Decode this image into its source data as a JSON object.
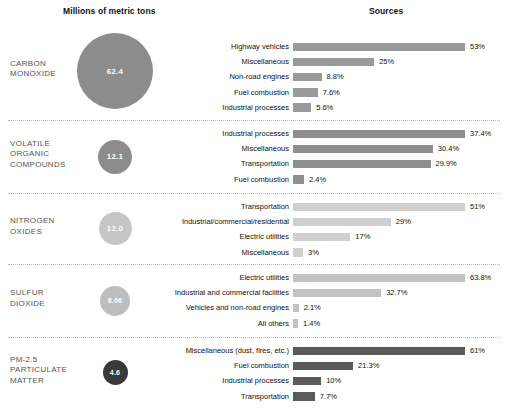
{
  "header": {
    "left_title": "Millions of metric tons",
    "right_title": "Sources"
  },
  "chart_data": {
    "type": "bar",
    "xlabel": "Sources",
    "ylabel": "Millions of metric tons",
    "grid": false,
    "legend": "none",
    "note": "Each pollutant panel shows total emissions (bubble, millions of metric tons) and the percentage breakdown of its sources (horizontal bars, normalized per panel).",
    "panels": [
      {
        "pollutant": "CARBON MONOXIDE",
        "total_label": "62.4",
        "total_value": 62.4,
        "bubble_diameter_px": 76,
        "bubble_color": "#8c8c8c",
        "bar_color": "#9a9a9a",
        "categories": [
          "Highway vehicles",
          "Miscellaneous",
          "Non-road engines",
          "Fuel combustion",
          "Industrial processes"
        ],
        "values": [
          53,
          25,
          8.8,
          7.6,
          5.6
        ],
        "value_labels": [
          "53%",
          "25%",
          "8.8%",
          "7.6%",
          "5.6%"
        ]
      },
      {
        "pollutant": "VOLATILE ORGANIC COMPOUNDS",
        "total_label": "12.1",
        "total_value": 12.1,
        "bubble_diameter_px": 34,
        "bubble_color": "#8c8c8c",
        "bar_color": "#8f8f8f",
        "categories": [
          "Industrial processes",
          "Miscellaneous",
          "Transportation",
          "Fuel combustion"
        ],
        "values": [
          37.4,
          30.4,
          29.9,
          2.4
        ],
        "value_labels": [
          "37.4%",
          "30.4%",
          "29.9%",
          "2.4%"
        ]
      },
      {
        "pollutant": "NITROGEN OXIDES",
        "total_label": "12.0",
        "total_value": 12.0,
        "bubble_diameter_px": 33,
        "bubble_color": "#c6c6c6",
        "bar_color": "#cfcfcf",
        "categories": [
          "Transportation",
          "Industrial/commercial/residential",
          "Electric utilities",
          "Miscellaneous"
        ],
        "values": [
          51,
          29,
          17,
          3
        ],
        "value_labels": [
          "51%",
          "29%",
          "17%",
          "3%"
        ]
      },
      {
        "pollutant": "SULFUR DIOXIDE",
        "total_label": "8.06",
        "total_value": 8.06,
        "bubble_diameter_px": 30,
        "bubble_color": "#bdbdbd",
        "bar_color": "#c2c2c2",
        "categories": [
          "Electric utilities",
          "Industrial and commercial facilities",
          "Vehicles and non-road engines",
          "All others"
        ],
        "values": [
          63.8,
          32.7,
          2.1,
          1.4
        ],
        "value_labels": [
          "63.8%",
          "32.7%",
          "2.1%",
          "1.4%"
        ]
      },
      {
        "pollutant": "PM-2.5 PARTICULATE MATTER",
        "total_label": "4.6",
        "total_value": 4.6,
        "bubble_diameter_px": 25,
        "bubble_color": "#3a3a3a",
        "bar_color": "#5a5a5a",
        "categories": [
          "Miscellaneous (dust, fires, etc.)",
          "Fuel combustion",
          "Industrial processes",
          "Transportation"
        ],
        "values": [
          61,
          21.3,
          10,
          7.7
        ],
        "value_labels": [
          "61%",
          "21.3%",
          "10%",
          "7.7%"
        ]
      }
    ]
  }
}
